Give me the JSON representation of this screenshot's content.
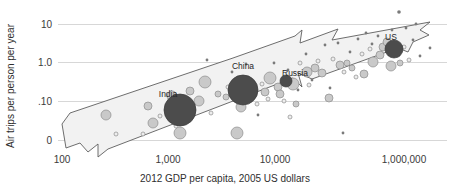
{
  "chart_data": {
    "type": "scatter",
    "title": "",
    "subtitle": "",
    "xlabel": "2012 GDP per capita, 2005 US dollars",
    "ylabel": "Air trips per person per year",
    "xscale": "log",
    "yscale": "log",
    "xlim": [
      100,
      1000000
    ],
    "ylim": [
      0.01,
      10
    ],
    "grid": true,
    "legend": null,
    "xticks": [
      {
        "label": "100",
        "value": 100,
        "px": 62
      },
      {
        "label": "1,000",
        "value": 1000,
        "px": 168
      },
      {
        "label": "10,000",
        "value": 10000,
        "px": 275
      },
      {
        "label": "1,000,000",
        "value": 1000000,
        "px": 404
      }
    ],
    "yticks": [
      {
        "label": "10",
        "value": 10,
        "px": 24
      },
      {
        "label": "1.0",
        "value": 1.0,
        "px": 62
      },
      {
        "label": ".10",
        "value": 0.1,
        "px": 101
      },
      {
        "label": "0",
        "value": 0.01,
        "px": 140
      }
    ],
    "annotations": [
      {
        "text": "India",
        "x_px": 168,
        "y_px": 97
      },
      {
        "text": "China",
        "x_px": 243,
        "y_px": 69
      },
      {
        "text": "Russia",
        "x_px": 295,
        "y_px": 76
      },
      {
        "text": "US",
        "x_px": 391,
        "y_px": 40
      }
    ],
    "trend_band": {
      "description": "shaded upward arrow band spanning the scatter cloud",
      "fill": "#f2f2f2",
      "stroke": "#5e5e5e"
    },
    "series": [
      {
        "name": "highlighted-countries",
        "style": "dark",
        "points": [
          {
            "label": "India",
            "cx": 180,
            "cy": 110,
            "r": 16
          },
          {
            "label": "China",
            "cx": 243,
            "cy": 90,
            "r": 15
          },
          {
            "label": "Russia",
            "cx": 286,
            "cy": 81,
            "r": 6
          },
          {
            "label": "US",
            "cx": 394,
            "cy": 49,
            "r": 9
          }
        ]
      },
      {
        "name": "other-countries",
        "style": "light",
        "points": [
          {
            "cx": 106,
            "cy": 115,
            "r": 5
          },
          {
            "cx": 148,
            "cy": 106,
            "r": 4
          },
          {
            "cx": 153,
            "cy": 123,
            "r": 5
          },
          {
            "cx": 172,
            "cy": 96,
            "r": 5
          },
          {
            "cx": 180,
            "cy": 133,
            "r": 6
          },
          {
            "cx": 190,
            "cy": 91,
            "r": 4
          },
          {
            "cx": 199,
            "cy": 101,
            "r": 5
          },
          {
            "cx": 205,
            "cy": 82,
            "r": 6
          },
          {
            "cx": 218,
            "cy": 94,
            "r": 3
          },
          {
            "cx": 226,
            "cy": 97,
            "r": 3
          },
          {
            "cx": 237,
            "cy": 133,
            "r": 6
          },
          {
            "cx": 241,
            "cy": 107,
            "r": 5
          },
          {
            "cx": 265,
            "cy": 92,
            "r": 4
          },
          {
            "cx": 270,
            "cy": 78,
            "r": 6
          },
          {
            "cx": 278,
            "cy": 87,
            "r": 4
          },
          {
            "cx": 280,
            "cy": 94,
            "r": 4
          },
          {
            "cx": 293,
            "cy": 84,
            "r": 6
          },
          {
            "cx": 296,
            "cy": 104,
            "r": 3
          },
          {
            "cx": 307,
            "cy": 72,
            "r": 5
          },
          {
            "cx": 315,
            "cy": 68,
            "r": 4
          },
          {
            "cx": 322,
            "cy": 73,
            "r": 4
          },
          {
            "cx": 329,
            "cy": 98,
            "r": 4
          },
          {
            "cx": 340,
            "cy": 65,
            "r": 4
          },
          {
            "cx": 347,
            "cy": 63,
            "r": 3
          },
          {
            "cx": 352,
            "cy": 68,
            "r": 3
          },
          {
            "cx": 364,
            "cy": 74,
            "r": 4
          },
          {
            "cx": 373,
            "cy": 62,
            "r": 5
          },
          {
            "cx": 380,
            "cy": 55,
            "r": 4
          },
          {
            "cx": 383,
            "cy": 47,
            "r": 4
          },
          {
            "cx": 387,
            "cy": 42,
            "r": 4
          },
          {
            "cx": 391,
            "cy": 66,
            "r": 5
          },
          {
            "cx": 400,
            "cy": 63,
            "r": 3
          }
        ]
      },
      {
        "name": "small-countries",
        "style": "hollow",
        "points": [
          {
            "cx": 116,
            "cy": 134,
            "r": 2
          },
          {
            "cx": 143,
            "cy": 134,
            "r": 2
          },
          {
            "cx": 160,
            "cy": 116,
            "r": 2
          },
          {
            "cx": 176,
            "cy": 126,
            "r": 2
          },
          {
            "cx": 193,
            "cy": 112,
            "r": 2
          },
          {
            "cx": 211,
            "cy": 113,
            "r": 2
          },
          {
            "cx": 228,
            "cy": 87,
            "r": 2
          },
          {
            "cx": 234,
            "cy": 83,
            "r": 2
          },
          {
            "cx": 251,
            "cy": 99,
            "r": 2
          },
          {
            "cx": 257,
            "cy": 104,
            "r": 2
          },
          {
            "cx": 262,
            "cy": 84,
            "r": 2
          },
          {
            "cx": 268,
            "cy": 99,
            "r": 2
          },
          {
            "cx": 284,
            "cy": 101,
            "r": 2
          },
          {
            "cx": 290,
            "cy": 117,
            "r": 2
          },
          {
            "cx": 300,
            "cy": 63,
            "r": 2
          },
          {
            "cx": 309,
            "cy": 85,
            "r": 2
          },
          {
            "cx": 318,
            "cy": 61,
            "r": 2
          },
          {
            "cx": 333,
            "cy": 59,
            "r": 2
          },
          {
            "cx": 344,
            "cy": 72,
            "r": 2
          },
          {
            "cx": 356,
            "cy": 77,
            "r": 2
          },
          {
            "cx": 362,
            "cy": 54,
            "r": 2
          },
          {
            "cx": 370,
            "cy": 49,
            "r": 2
          },
          {
            "cx": 398,
            "cy": 55,
            "r": 2
          },
          {
            "cx": 404,
            "cy": 47,
            "r": 2
          },
          {
            "cx": 409,
            "cy": 60,
            "r": 2
          }
        ]
      },
      {
        "name": "dot-markers",
        "style": "tiny",
        "points": [
          {
            "cx": 207,
            "cy": 60,
            "r": 1.4
          },
          {
            "cx": 232,
            "cy": 72,
            "r": 1.4
          },
          {
            "cx": 246,
            "cy": 64,
            "r": 1.4
          },
          {
            "cx": 258,
            "cy": 115,
            "r": 1.4
          },
          {
            "cx": 274,
            "cy": 63,
            "r": 1.4
          },
          {
            "cx": 288,
            "cy": 70,
            "r": 1.4
          },
          {
            "cx": 298,
            "cy": 90,
            "r": 1.4
          },
          {
            "cx": 306,
            "cy": 54,
            "r": 1.4
          },
          {
            "cx": 312,
            "cy": 80,
            "r": 1.4
          },
          {
            "cx": 325,
            "cy": 45,
            "r": 1.4
          },
          {
            "cx": 330,
            "cy": 88,
            "r": 1.4
          },
          {
            "cx": 338,
            "cy": 43,
            "r": 1.4
          },
          {
            "cx": 343,
            "cy": 133,
            "r": 1.4
          },
          {
            "cx": 350,
            "cy": 52,
            "r": 1.4
          },
          {
            "cx": 358,
            "cy": 39,
            "r": 1.4
          },
          {
            "cx": 366,
            "cy": 33,
            "r": 1.4
          },
          {
            "cx": 372,
            "cy": 44,
            "r": 1.4
          },
          {
            "cx": 378,
            "cy": 36,
            "r": 1.4
          },
          {
            "cx": 392,
            "cy": 30,
            "r": 1.4
          },
          {
            "cx": 399,
            "cy": 12,
            "r": 1.8
          },
          {
            "cx": 406,
            "cy": 28,
            "r": 1.4
          },
          {
            "cx": 413,
            "cy": 40,
            "r": 1.4
          },
          {
            "cx": 416,
            "cy": 24,
            "r": 1.4
          },
          {
            "cx": 420,
            "cy": 56,
            "r": 1.4
          },
          {
            "cx": 430,
            "cy": 48,
            "r": 1.4
          }
        ]
      }
    ]
  }
}
